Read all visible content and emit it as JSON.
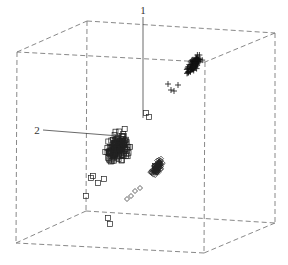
{
  "chart_data": {
    "type": "scatter",
    "projection": "3d",
    "title": "",
    "xlabel": "",
    "ylabel": "",
    "zlabel": "",
    "grid": false,
    "legend": null,
    "annotations": [
      {
        "text": "1",
        "x": 143,
        "y": 14,
        "target_x": 143,
        "target_y": 118
      },
      {
        "text": "2",
        "x": 37,
        "y": 134,
        "target_x": 119,
        "target_y": 136
      }
    ],
    "bounding_box": {
      "style": "dashed",
      "vertices": {
        "top_back_left": [
          87,
          21
        ],
        "top_back_right": [
          275,
          33
        ],
        "top_front_left": [
          17,
          52
        ],
        "top_front_right": [
          205,
          62
        ],
        "bottom_back_left": [
          86,
          211
        ],
        "bottom_back_right": [
          275,
          223
        ],
        "bottom_front_left": [
          16,
          243
        ],
        "bottom_front_right": [
          204,
          253
        ]
      }
    },
    "series": [
      {
        "name": "cluster-squares",
        "marker": "square",
        "center": [
          118,
          148
        ],
        "spread": [
          14,
          22
        ],
        "angle_deg": -58,
        "count": 170,
        "outliers": [
          [
            86,
            196
          ],
          [
            91,
            178
          ],
          [
            93,
            176
          ],
          [
            98,
            183
          ],
          [
            104,
            179
          ],
          [
            108,
            218
          ],
          [
            110,
            224
          ],
          [
            155,
            166
          ],
          [
            149,
            117
          ],
          [
            146,
            113
          ]
        ]
      },
      {
        "name": "cluster-plus",
        "marker": "plus",
        "center": [
          193,
          65
        ],
        "spread": [
          6,
          18
        ],
        "angle_deg": -55,
        "count": 80,
        "outliers": [
          [
            168,
            84
          ],
          [
            171,
            90
          ],
          [
            174,
            91
          ],
          [
            178,
            85
          ]
        ]
      },
      {
        "name": "cluster-diamonds",
        "marker": "diamond",
        "center": [
          157,
          168
        ],
        "spread": [
          5,
          12
        ],
        "angle_deg": -55,
        "count": 90,
        "outliers": [
          [
            127,
            199
          ],
          [
            131,
            196
          ],
          [
            135,
            191
          ],
          [
            140,
            188
          ]
        ]
      }
    ]
  }
}
